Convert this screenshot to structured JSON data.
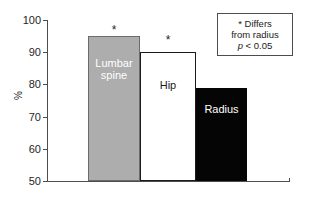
{
  "chart_data": {
    "type": "bar",
    "title": "",
    "subtitle": "",
    "xlabel": "",
    "ylabel": "%",
    "ylim": [
      50,
      100
    ],
    "yticks": [
      50,
      60,
      70,
      80,
      90,
      100
    ],
    "ytick_labels": [
      "50",
      "60",
      "70",
      "80",
      "90",
      "100"
    ],
    "grid": false,
    "legend_position": "top-right",
    "categories": [
      "Lumbar spine",
      "Hip",
      "Radius"
    ],
    "values": [
      95,
      90,
      79
    ],
    "bar_labels": [
      "Lumbar\nspine",
      "Hip",
      "Radius"
    ],
    "bar_colors": [
      "#adadad",
      "#ffffff",
      "#050505"
    ],
    "bar_label_colors": [
      "#ffffff",
      "#1a1a1a",
      "#ffffff"
    ],
    "significance_markers": [
      "*",
      "*",
      ""
    ],
    "annotations": [
      {
        "text": "* Differs from radius p < 0.05",
        "position": "top-right"
      }
    ]
  },
  "axes": {
    "y_title": "%",
    "ticks": [
      {
        "value": 100,
        "label": "100"
      },
      {
        "value": 90,
        "label": "90"
      },
      {
        "value": 80,
        "label": "80"
      },
      {
        "value": 70,
        "label": "70"
      },
      {
        "value": 60,
        "label": "60"
      },
      {
        "value": 50,
        "label": "50"
      }
    ]
  },
  "bars": [
    {
      "name": "lumbar-spine",
      "label_line1": "Lumbar",
      "label_line2": "spine",
      "value": 95,
      "marker": "*"
    },
    {
      "name": "hip",
      "label_line1": "Hip",
      "label_line2": "",
      "value": 90,
      "marker": "*"
    },
    {
      "name": "radius",
      "label_line1": "Radius",
      "label_line2": "",
      "value": 79,
      "marker": ""
    }
  ],
  "note": {
    "line1": "* Differs",
    "line2": "from radius",
    "p_symbol": "p",
    "p_value": " < 0.05"
  },
  "colors": {
    "bar_gray": "#adadad",
    "bar_white": "#ffffff",
    "bar_black": "#050505",
    "axis": "#4d4d4d",
    "text": "#1a1a1a",
    "background": "#ffffff"
  }
}
